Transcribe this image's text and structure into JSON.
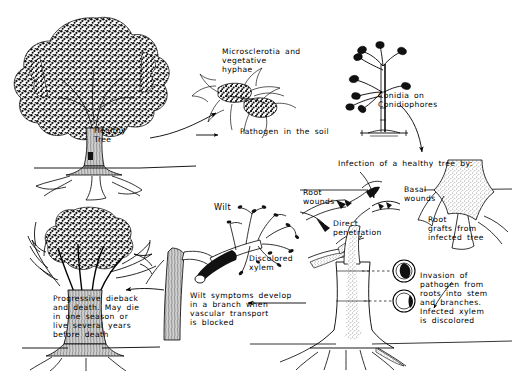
{
  "diagram": {
    "type": "disease-cycle-illustration",
    "ink_color": "#000000",
    "background_color": "#ffffff"
  },
  "labels": {
    "healthy_tree": "Healthy\nTree",
    "microsclerotia": "Microsclerotia   and\nvegetative\nhyphae",
    "pathogen_in_soil": "Pathogen   in   the   soil",
    "conidia": "Conidia   on\nConidiophores",
    "infection_heading": "Infection  of  a  healthy  tree  by:",
    "root_wounds": "Root\nwounds",
    "basal_wounds": "Basal\nwounds",
    "direct_penetration": "Direct\npenetration",
    "root_grafts": "Root\ngrafts  from\ninfected  tree",
    "invasion": "Invasion  of\npathogen   from\nroots  into  stem\nand    branches.\nInfected   xylem\nis   discolored",
    "wilt": "Wilt",
    "discolored_xylem": "Discolored\nxylem",
    "wilt_symptoms": "Wilt   symptoms   develop\nin   a   branch   when\nvascular    transport\nis    blocked",
    "progressive_dieback": "Progressive   dieback\nand  death.  May  die\nin   one   season   or\nlive   several   years\nbefore    death"
  },
  "stages": [
    {
      "id": "healthy-tree",
      "label": "Healthy Tree"
    },
    {
      "id": "pathogen-soil",
      "label": "Pathogen in the soil"
    },
    {
      "id": "conidiophores",
      "label": "Conidia on Conidiophores"
    },
    {
      "id": "infection",
      "label": "Infection of a healthy tree by:"
    },
    {
      "id": "xylem-invasion",
      "label": "Invasion of pathogen from roots into stem and branches. Infected xylem is discolored"
    },
    {
      "id": "wilt",
      "label": "Wilt symptoms develop in a branch when vascular transport is blocked"
    },
    {
      "id": "dieback",
      "label": "Progressive dieback and death"
    }
  ]
}
